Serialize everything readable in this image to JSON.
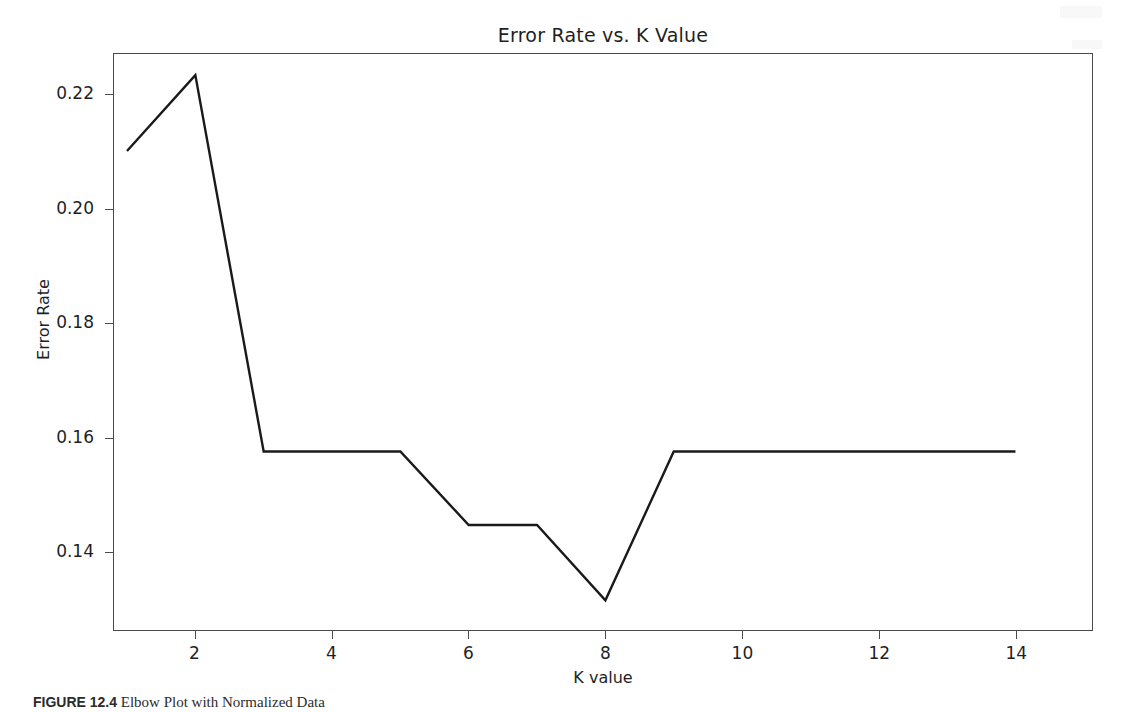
{
  "chart_data": {
    "type": "line",
    "title": "Error Rate vs. K Value",
    "xlabel": "K value",
    "ylabel": "Error Rate",
    "x": [
      1,
      2,
      3,
      4,
      5,
      6,
      7,
      8,
      9,
      10,
      11,
      12,
      13,
      14
    ],
    "values": [
      0.2102,
      0.2235,
      0.1575,
      0.1575,
      0.1575,
      0.1446,
      0.1446,
      0.1314,
      0.1575,
      0.1575,
      0.1575,
      0.1575,
      0.1575,
      0.1575
    ],
    "series": [
      {
        "name": "Error Rate",
        "values": [
          0.2102,
          0.2235,
          0.1575,
          0.1575,
          0.1575,
          0.1446,
          0.1446,
          0.1314,
          0.1575,
          0.1575,
          0.1575,
          0.1575,
          0.1575,
          0.1575
        ]
      }
    ],
    "xlim": [
      0.81,
      15.12
    ],
    "ylim": [
      0.1262,
      0.2272
    ],
    "xticks": [
      2,
      4,
      6,
      8,
      10,
      12,
      14
    ],
    "xtick_labels": [
      "2",
      "4",
      "6",
      "8",
      "10",
      "12",
      "14"
    ],
    "yticks": [
      0.14,
      0.16,
      0.18,
      0.2,
      0.22
    ],
    "ytick_labels": [
      "0.14",
      "0.16",
      "0.18",
      "0.20",
      "0.22"
    ],
    "grid": false,
    "legend": null,
    "line_color": "#1a1a1a",
    "line_width": 2.2,
    "markers": false
  },
  "caption": {
    "label": "FIGURE 12.4",
    "text": "Elbow Plot with Normalized Data"
  }
}
